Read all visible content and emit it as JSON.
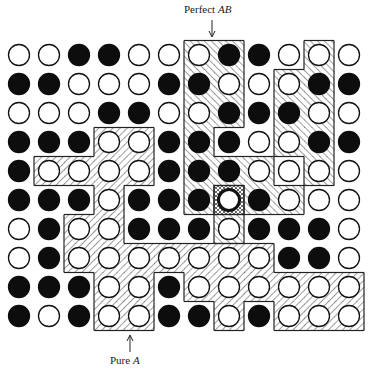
{
  "labels": {
    "top": {
      "text_prefix": "Perfect ",
      "text_italic": "AB"
    },
    "bottom": {
      "text_prefix": "Pure ",
      "text_italic": "A"
    }
  },
  "grid": {
    "cols": 12,
    "rows": 10,
    "legend": {
      "W": "open circle (A atom)",
      "B": "filled circle (B atom)"
    },
    "cells": [
      "WWBBWWWBBWWW",
      "BBWWWBBWWWBB",
      "WWWBBWWBBBWW",
      "BBBWWBBBWWBB",
      "BWWWWBBBWWWW",
      "BBBWBBBWBWWW",
      "WBWWBBBWBBBW",
      "WBWWWWWWWBBW",
      "BBBWWBWWWWWW",
      "BWBWWBBWBWWW"
    ],
    "highlighted_cell": {
      "row": 5,
      "col": 7
    }
  },
  "regions": {
    "perfect_ab": [
      [
        0,
        6
      ],
      [
        0,
        7
      ],
      [
        1,
        6
      ],
      [
        1,
        7
      ],
      [
        2,
        6
      ],
      [
        2,
        7
      ],
      [
        3,
        6
      ],
      [
        4,
        6
      ],
      [
        4,
        7
      ],
      [
        4,
        8
      ],
      [
        5,
        6
      ],
      [
        5,
        8
      ],
      [
        5,
        9
      ],
      [
        6,
        7
      ],
      [
        0,
        10
      ],
      [
        1,
        9
      ],
      [
        1,
        10
      ],
      [
        2,
        9
      ],
      [
        2,
        10
      ],
      [
        3,
        9
      ],
      [
        3,
        10
      ],
      [
        4,
        10
      ]
    ],
    "pure_a": [
      [
        3,
        3
      ],
      [
        3,
        4
      ],
      [
        4,
        1
      ],
      [
        4,
        2
      ],
      [
        4,
        3
      ],
      [
        4,
        4
      ],
      [
        5,
        3
      ],
      [
        6,
        2
      ],
      [
        6,
        3
      ],
      [
        7,
        2
      ],
      [
        7,
        3
      ],
      [
        7,
        4
      ],
      [
        7,
        5
      ],
      [
        7,
        6
      ],
      [
        7,
        7
      ],
      [
        7,
        8
      ],
      [
        8,
        3
      ],
      [
        8,
        4
      ],
      [
        8,
        6
      ],
      [
        8,
        7
      ],
      [
        8,
        8
      ],
      [
        8,
        9
      ],
      [
        8,
        10
      ],
      [
        8,
        11
      ],
      [
        9,
        3
      ],
      [
        9,
        4
      ],
      [
        9,
        7
      ],
      [
        9,
        9
      ],
      [
        9,
        10
      ],
      [
        9,
        11
      ]
    ]
  },
  "colors": {
    "ink": "#111111",
    "paper": "#ffffff",
    "hatch": "#555555"
  }
}
